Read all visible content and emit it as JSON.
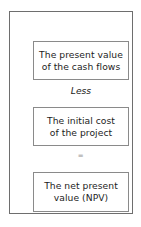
{
  "diagram": {
    "type": "vertical-flow",
    "frame": {
      "border_color": "#6e6e6e"
    },
    "box_border_color": "#8a8a8a",
    "text_color": "#1d1d1d",
    "background_color": "#ffffff",
    "steps": [
      {
        "id": "present-value-of-cash-flows",
        "text": "The present value\nof the cash flows"
      },
      {
        "id": "initial-cost-of-project",
        "text": "The initial cost\nof the project"
      },
      {
        "id": "net-present-value",
        "text": "The net present\nvalue (NPV)"
      }
    ],
    "operators": [
      {
        "id": "less",
        "symbol": "Less"
      },
      {
        "id": "equals",
        "symbol": "="
      }
    ]
  }
}
